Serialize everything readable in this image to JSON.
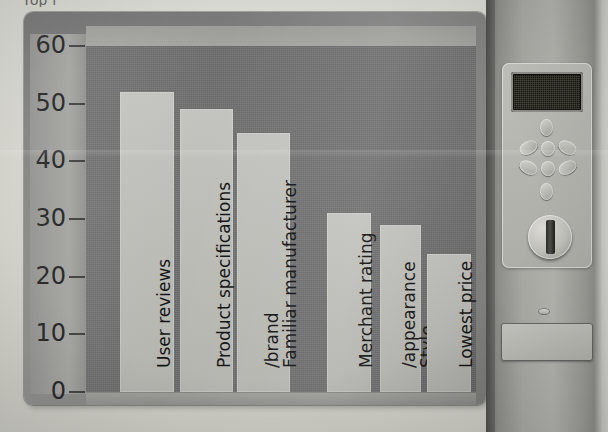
{
  "page": {
    "cut_off_title": "Top f",
    "background_color": "#d2d2cc"
  },
  "chart_frame": {
    "card_color": "#7b7b7b",
    "plot_color": "#6e6e6e",
    "axis_band_color": "#9a9a97",
    "bar_color": "#bdbdb8"
  },
  "chart_data": {
    "type": "bar",
    "title": "",
    "xlabel": "",
    "ylabel": "",
    "ylim": [
      0,
      60
    ],
    "yticks": [
      0,
      10,
      20,
      30,
      40,
      50,
      60
    ],
    "ytick_labels": [
      "0",
      "10",
      "20",
      "30",
      "40",
      "50",
      "60"
    ],
    "grid": false,
    "legend": "none",
    "orientation": "vertical",
    "categories": [
      "User reviews",
      "Product specifications",
      "Familiar manufacturer /brand",
      "Merchant rating",
      "Style /appearance",
      "Lowest price"
    ],
    "category_lines": [
      [
        "User reviews"
      ],
      [
        "Product specifications"
      ],
      [
        "Familiar manufacturer",
        "/brand"
      ],
      [
        "Merchant rating"
      ],
      [
        "Style",
        "/appearance"
      ],
      [
        "Lowest price"
      ]
    ],
    "values": [
      52,
      49,
      45,
      31,
      29,
      24
    ]
  },
  "device_panel": {
    "name": "control-panel",
    "display": {
      "name": "lcd-display",
      "text": ""
    },
    "buttons": [
      {
        "name": "up-button",
        "label": ""
      },
      {
        "name": "left-button",
        "label": ""
      },
      {
        "name": "center-button",
        "label": ""
      },
      {
        "name": "right-button",
        "label": ""
      },
      {
        "name": "lower-left-button",
        "label": ""
      },
      {
        "name": "lower-center-button",
        "label": ""
      },
      {
        "name": "lower-right-button",
        "label": ""
      },
      {
        "name": "down-button",
        "label": ""
      }
    ],
    "knob": {
      "name": "rotary-knob",
      "label": ""
    },
    "indicator": {
      "name": "status-led",
      "label": ""
    },
    "tray": {
      "name": "front-tray",
      "label": ""
    }
  }
}
